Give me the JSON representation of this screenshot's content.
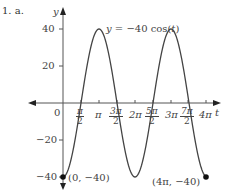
{
  "problem_label": "1. a.",
  "chart_data": {
    "type": "line",
    "title": "",
    "function_label": "y = −40 cos(t)",
    "xlabel": "t",
    "ylabel": "y",
    "xlim": [
      0,
      12.566
    ],
    "ylim": [
      -40,
      40
    ],
    "x_ticks": [
      "π/2",
      "π",
      "3π/2",
      "2π",
      "5π/2",
      "3π",
      "7π/2",
      "4π"
    ],
    "y_ticks": [
      40,
      20,
      -20,
      -40
    ],
    "origin_label": "0",
    "grid": false,
    "series": [
      {
        "name": "y = -40 cos(t)",
        "x": [
          0,
          1.5708,
          3.1416,
          4.7124,
          6.2832,
          7.854,
          9.4248,
          10.9956,
          12.5664
        ],
        "values": [
          -40,
          0,
          40,
          0,
          -40,
          0,
          40,
          0,
          -40
        ]
      }
    ],
    "annotations": [
      {
        "label": "(0, −40)",
        "x": 0,
        "y": -40
      },
      {
        "label": "(4π, −40)",
        "x": 12.5664,
        "y": -40
      }
    ]
  },
  "ticks": {
    "x": [
      {
        "num": "π",
        "den": "2"
      },
      {
        "text": "π"
      },
      {
        "num": "3π",
        "den": "2"
      },
      {
        "text": "2π"
      },
      {
        "num": "5π",
        "den": "2"
      },
      {
        "text": "3π"
      },
      {
        "num": "7π",
        "den": "2"
      },
      {
        "text": "4π"
      }
    ],
    "y": [
      "40",
      "20",
      "−20",
      "−40"
    ]
  }
}
